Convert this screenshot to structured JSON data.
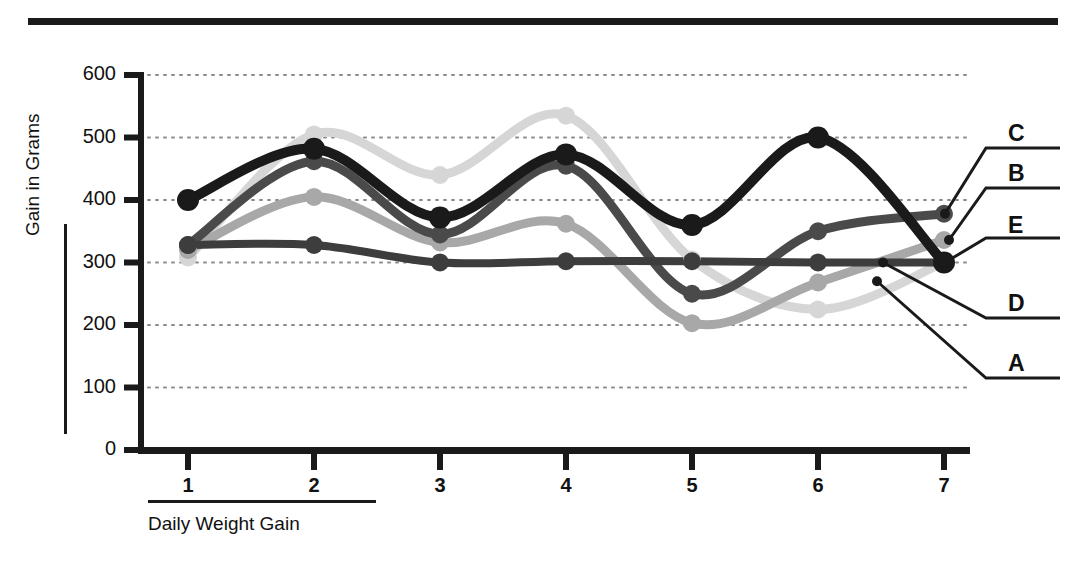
{
  "chart_data": {
    "type": "line",
    "title": "",
    "xlabel": "Daily Weight Gain",
    "ylabel": "Gain in Grams",
    "categories": [
      "1",
      "2",
      "3",
      "4",
      "5",
      "6",
      "7"
    ],
    "x": [
      1,
      2,
      3,
      4,
      5,
      6,
      7
    ],
    "xlim": [
      0.55,
      7.45
    ],
    "ylim": [
      0,
      600
    ],
    "yticks": [
      0,
      100,
      200,
      300,
      400,
      500,
      600
    ],
    "ytick_labels": [
      "0",
      "100",
      "200",
      "300",
      "400",
      "500",
      "600"
    ],
    "xtick_labels": [
      "1",
      "2",
      "3",
      "4",
      "5",
      "6",
      "7"
    ],
    "grid": "horizontal-dotted",
    "legend_position": "right-callout",
    "series": [
      {
        "name": "C",
        "label": "C",
        "color": "#4a4a4a",
        "width": 9,
        "marker": "circle",
        "marker_size": 9,
        "values": [
          328,
          462,
          345,
          455,
          250,
          350,
          378
        ]
      },
      {
        "name": "B",
        "label": "B",
        "color": "#a8a8a8",
        "width": 9,
        "marker": "circle",
        "marker_size": 9,
        "values": [
          320,
          405,
          332,
          362,
          203,
          268,
          336
        ]
      },
      {
        "name": "E",
        "label": "E",
        "color": "#1a1a1a",
        "width": 10,
        "marker": "circle",
        "marker_size": 11,
        "values": [
          400,
          482,
          372,
          473,
          360,
          500,
          300
        ]
      },
      {
        "name": "D",
        "label": "D",
        "color": "#3d3d3d",
        "width": 8,
        "marker": "circle",
        "marker_size": 9,
        "values": [
          328,
          328,
          300,
          302,
          302,
          300,
          300
        ]
      },
      {
        "name": "A",
        "label": "A",
        "color": "#d6d6d6",
        "width": 9,
        "marker": "circle",
        "marker_size": 9,
        "values": [
          308,
          505,
          440,
          535,
          305,
          225,
          300
        ]
      }
    ],
    "callouts": [
      {
        "label": "C",
        "series": "C"
      },
      {
        "label": "B",
        "series": "B"
      },
      {
        "label": "E",
        "series": "E"
      },
      {
        "label": "D",
        "series": "D"
      },
      {
        "label": "A",
        "series": "A"
      }
    ],
    "colors": {
      "axis": "#1a1a1a",
      "grid": "#8c8c8c",
      "background": "#ffffff",
      "text": "#111111"
    }
  }
}
